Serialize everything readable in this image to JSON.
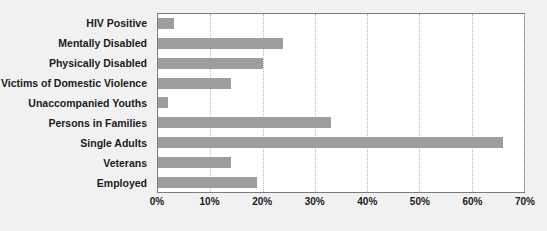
{
  "chart_data": {
    "type": "bar",
    "orientation": "horizontal",
    "title": "",
    "xlabel": "",
    "ylabel": "",
    "categories": [
      "HIV Positive",
      "Mentally Disabled",
      "Physically Disabled",
      "Victims of Domestic Violence",
      "Unaccompanied Youths",
      "Persons in Families",
      "Single Adults",
      "Veterans",
      "Employed"
    ],
    "values": [
      3,
      24,
      20,
      14,
      2,
      33,
      66,
      14,
      19
    ],
    "value_suffix": "%",
    "xlim": [
      0,
      70
    ],
    "xticks": [
      0,
      10,
      20,
      30,
      40,
      50,
      60,
      70
    ],
    "xtick_labels": [
      "0%",
      "10%",
      "20%",
      "30%",
      "40%",
      "50%",
      "60%",
      "70%"
    ],
    "grid": true,
    "grid_axis": "x",
    "legend": "none",
    "colors": {
      "bar": "#9d9d9d",
      "plot_background": "#ffffff",
      "page_background": "#f1f1f1",
      "plot_border": "#7b7b82",
      "gridline": "#b9b9bd",
      "text": "#1b1b1b"
    }
  }
}
